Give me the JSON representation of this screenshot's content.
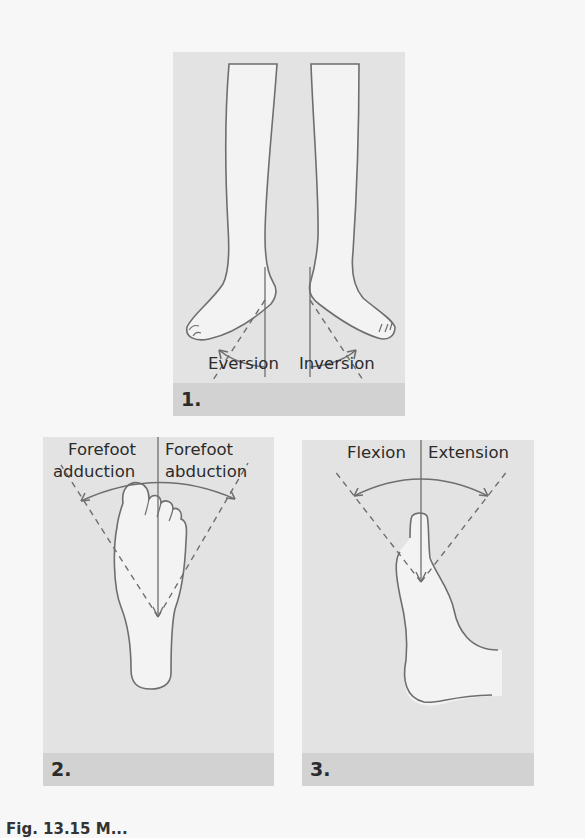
{
  "figure": {
    "panels": [
      {
        "number": "1.",
        "labels": {
          "left": "Eversion",
          "right": "Inversion"
        }
      },
      {
        "number": "2.",
        "labels": {
          "left_line1": "Forefoot",
          "left_line2": "adduction",
          "right_line1": "Forefoot",
          "right_line2": "abduction"
        }
      },
      {
        "number": "3.",
        "labels": {
          "left": "Flexion",
          "right": "Extension"
        }
      }
    ],
    "caption_visible": "Fig. 13.15  M..."
  },
  "colors": {
    "page_bg": "#f7f7f7",
    "panel_bg": "#e3e3e3",
    "strip_bg": "#d2d2d2",
    "line": "#6e6e6e",
    "skin": "#f3f3f3"
  }
}
